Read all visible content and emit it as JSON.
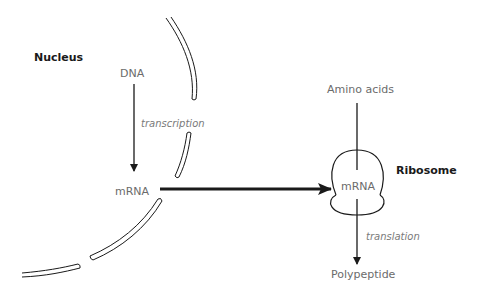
{
  "diagram": {
    "labels": {
      "nucleus": "Nucleus",
      "dna": "DNA",
      "transcription": "transcription",
      "mrna_nucleus": "mRNA",
      "amino_acids": "Amino acids",
      "mrna_ribosome": "mRNA",
      "ribosome": "Ribosome",
      "translation": "translation",
      "polypeptide": "Polypeptide"
    },
    "flow": [
      {
        "from": "DNA",
        "to": "mRNA",
        "process": "transcription"
      },
      {
        "from": "mRNA (nucleus)",
        "to": "mRNA (ribosome)",
        "process": ""
      },
      {
        "from": "Amino acids",
        "to": "Ribosome",
        "process": ""
      },
      {
        "from": "mRNA (ribosome)",
        "to": "Polypeptide",
        "process": "translation"
      }
    ],
    "colors": {
      "line": "#1a1a1a",
      "label": "#6b6b6b",
      "process_label": "#7a7a7a"
    }
  }
}
